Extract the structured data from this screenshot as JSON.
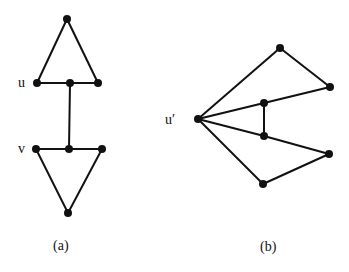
{
  "figure_a": {
    "caption": "(a)",
    "vertex_labels": {
      "u": "u",
      "v": "v"
    },
    "nodes": [
      {
        "id": "a_top",
        "x": 67,
        "y": 19
      },
      {
        "id": "a_u",
        "x": 37,
        "y": 83,
        "label": "u"
      },
      {
        "id": "a_um",
        "x": 70,
        "y": 83
      },
      {
        "id": "a_ur",
        "x": 98,
        "y": 83
      },
      {
        "id": "a_v",
        "x": 36,
        "y": 149,
        "label": "v"
      },
      {
        "id": "a_vm",
        "x": 69,
        "y": 149
      },
      {
        "id": "a_vr",
        "x": 102,
        "y": 149
      },
      {
        "id": "a_bot",
        "x": 68,
        "y": 213
      }
    ],
    "edges": [
      [
        "a_top",
        "a_u"
      ],
      [
        "a_top",
        "a_ur"
      ],
      [
        "a_u",
        "a_um"
      ],
      [
        "a_um",
        "a_ur"
      ],
      [
        "a_um",
        "a_vm"
      ],
      [
        "a_v",
        "a_vm"
      ],
      [
        "a_vm",
        "a_vr"
      ],
      [
        "a_v",
        "a_bot"
      ],
      [
        "a_vr",
        "a_bot"
      ]
    ]
  },
  "figure_b": {
    "caption": "(b)",
    "vertex_labels": {
      "u_prime": "u′"
    },
    "nodes": [
      {
        "id": "b_u",
        "x": 198,
        "y": 119,
        "label": "u′"
      },
      {
        "id": "b_top",
        "x": 280,
        "y": 48
      },
      {
        "id": "b_rt",
        "x": 330,
        "y": 87
      },
      {
        "id": "b_it",
        "x": 264,
        "y": 103
      },
      {
        "id": "b_ib",
        "x": 264,
        "y": 136
      },
      {
        "id": "b_rb",
        "x": 329,
        "y": 154
      },
      {
        "id": "b_bot",
        "x": 263,
        "y": 184
      }
    ],
    "edges": [
      [
        "b_u",
        "b_top"
      ],
      [
        "b_top",
        "b_rt"
      ],
      [
        "b_u",
        "b_it"
      ],
      [
        "b_it",
        "b_rt"
      ],
      [
        "b_it",
        "b_ib"
      ],
      [
        "b_u",
        "b_ib"
      ],
      [
        "b_ib",
        "b_rb"
      ],
      [
        "b_u",
        "b_bot"
      ],
      [
        "b_bot",
        "b_rb"
      ]
    ]
  }
}
